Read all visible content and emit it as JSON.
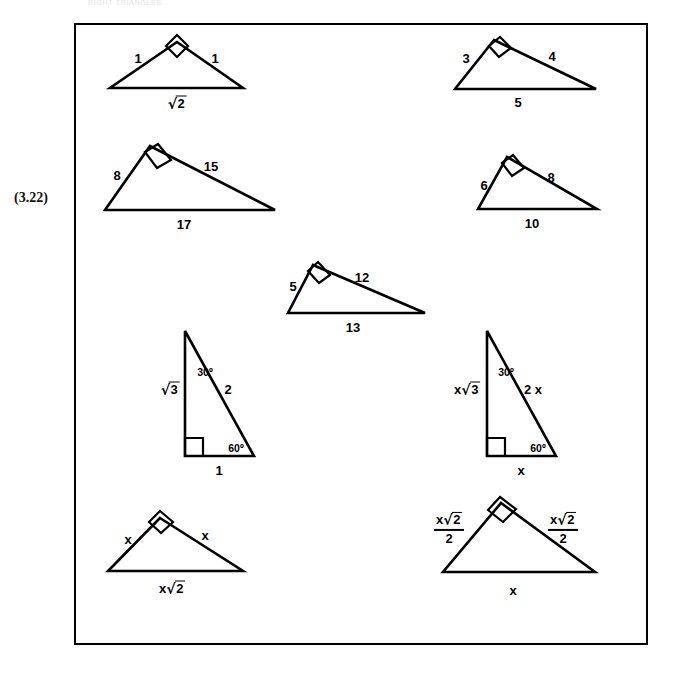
{
  "page": {
    "running_head": "RIGHT TRIANGLES",
    "equation_number": "(3.22)",
    "width": 676,
    "height": 679,
    "ink_color": "#000000",
    "background_color": "#ffffff"
  },
  "figure": {
    "box": {
      "left": 74,
      "top": 23,
      "width": 574,
      "height": 622
    },
    "triangles": [
      {
        "id": "tri-1-1-sqrt2",
        "name": "isosceles-right-1-1-sqrt2",
        "vertices": {
          "apex": [
            177,
            42
          ],
          "left": [
            110,
            88
          ],
          "right": [
            243,
            88
          ]
        },
        "right_angle_at": "apex",
        "labels": {
          "left_leg": "1",
          "right_leg": "1",
          "base": "√2",
          "base_is_radical": true,
          "base_radicand": "2"
        }
      },
      {
        "id": "tri-3-4-5",
        "name": "right-triangle-3-4-5",
        "vertices": {
          "apex": [
            494,
            40
          ],
          "left": [
            455,
            89
          ],
          "right": [
            596,
            89
          ]
        },
        "right_angle_at": "apex",
        "labels": {
          "left_leg": "3",
          "right_leg": "4",
          "base": "5"
        }
      },
      {
        "id": "tri-8-15-17",
        "name": "right-triangle-8-15-17",
        "vertices": {
          "apex": [
            150,
            146
          ],
          "left": [
            105,
            210
          ],
          "right": [
            275,
            210
          ]
        },
        "right_angle_at": "apex",
        "labels": {
          "left_leg": "8",
          "right_leg": "15",
          "base": "17"
        }
      },
      {
        "id": "tri-6-8-10",
        "name": "right-triangle-6-8-10",
        "vertices": {
          "apex": [
            507,
            157
          ],
          "left": [
            478,
            209
          ],
          "right": [
            597,
            209
          ]
        },
        "right_angle_at": "apex",
        "labels": {
          "left_leg": "6",
          "right_leg": "8",
          "base": "10"
        }
      },
      {
        "id": "tri-5-12-13",
        "name": "right-triangle-5-12-13",
        "vertices": {
          "apex": [
            313,
            265
          ],
          "left": [
            288,
            313
          ],
          "right": [
            425,
            313
          ]
        },
        "right_angle_at": "apex",
        "labels": {
          "left_leg": "5",
          "right_leg": "12",
          "base": "13"
        }
      },
      {
        "id": "tri-30-60-90-unit",
        "name": "thirty-sixty-ninety-unit-triangle",
        "vertices": {
          "top": [
            185,
            331
          ],
          "bottom_left": [
            185,
            456
          ],
          "bottom_right": [
            254,
            456
          ]
        },
        "right_angle_at": "bottom_left",
        "labels": {
          "vertical_leg": "√3",
          "vertical_leg_is_radical": true,
          "vertical_leg_radicand": "3",
          "hypotenuse": "2",
          "base": "1",
          "angle_top": "30º",
          "angle_bottom_right": "60º"
        }
      },
      {
        "id": "tri-30-60-90-x",
        "name": "thirty-sixty-ninety-scaled-triangle",
        "vertices": {
          "top": [
            487,
            331
          ],
          "bottom_left": [
            487,
            456
          ],
          "bottom_right": [
            556,
            456
          ]
        },
        "right_angle_at": "bottom_left",
        "labels": {
          "vertical_leg_prefix": "x",
          "vertical_leg_radicand": "3",
          "hypotenuse": "2 x",
          "base": "x",
          "angle_top": "30º",
          "angle_bottom_right": "60º"
        }
      },
      {
        "id": "tri-x-x-xsqrt2",
        "name": "isosceles-right-x-x-x-sqrt2",
        "vertices": {
          "apex": [
            160,
            518
          ],
          "left": [
            108,
            571
          ],
          "right": [
            243,
            571
          ]
        },
        "right_angle_at": "apex",
        "labels": {
          "left_leg": "x",
          "right_leg": "x",
          "base_prefix": "x",
          "base_radicand": "2"
        }
      },
      {
        "id": "tri-xsqrt2over2",
        "name": "isosceles-right-half-x-sqrt-two",
        "vertices": {
          "apex": [
            501,
            503
          ],
          "left": [
            443,
            572
          ],
          "right": [
            595,
            572
          ]
        },
        "right_angle_at": "apex",
        "labels": {
          "left_leg_numerator_prefix": "x",
          "left_leg_numerator_radicand": "2",
          "left_leg_denominator": "2",
          "right_leg_numerator_prefix": "x",
          "right_leg_numerator_radicand": "2",
          "right_leg_denominator": "2",
          "base": "x"
        }
      }
    ]
  }
}
